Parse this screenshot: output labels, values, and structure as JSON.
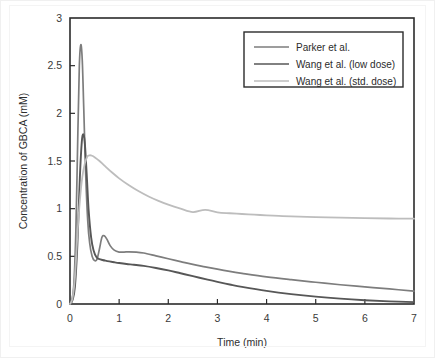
{
  "chart_data": {
    "type": "line",
    "title": "",
    "xlabel": "Time (min)",
    "ylabel": "Concentration of GBCA (mM)",
    "xlim": [
      0,
      7
    ],
    "ylim": [
      0,
      3
    ],
    "xticks": [
      0,
      1,
      2,
      3,
      4,
      5,
      6,
      7
    ],
    "xtick_labels": [
      "0",
      "1",
      "2",
      "3",
      "4",
      "5",
      "6",
      "7"
    ],
    "yticks": [
      0,
      0.5,
      1,
      1.5,
      2,
      2.5,
      3
    ],
    "ytick_labels": [
      "0",
      "0.5",
      "1",
      "1.5",
      "2",
      "2.5",
      "3"
    ],
    "grid": false,
    "legend_position": "top-right",
    "series": [
      {
        "name": "Parker et al.",
        "color": "#7d7d7d",
        "linewidth": 1.7,
        "x": [
          0,
          0.04,
          0.08,
          0.12,
          0.16,
          0.19,
          0.22,
          0.25,
          0.28,
          0.32,
          0.36,
          0.4,
          0.45,
          0.5,
          0.55,
          0.6,
          0.65,
          0.7,
          0.75,
          0.82,
          0.9,
          1.0,
          1.1,
          1.2,
          1.35,
          1.5,
          1.75,
          2.0,
          2.25,
          2.5,
          2.75,
          3.0,
          3.25,
          3.5,
          4.0,
          4.5,
          5.0,
          5.5,
          6.0,
          6.5,
          7.0
        ],
        "y": [
          0.0,
          0.05,
          0.22,
          0.78,
          1.8,
          2.5,
          2.72,
          2.55,
          2.05,
          1.35,
          0.88,
          0.64,
          0.5,
          0.455,
          0.47,
          0.58,
          0.7,
          0.715,
          0.68,
          0.61,
          0.565,
          0.545,
          0.545,
          0.547,
          0.545,
          0.535,
          0.505,
          0.475,
          0.445,
          0.415,
          0.39,
          0.365,
          0.342,
          0.322,
          0.285,
          0.255,
          0.228,
          0.202,
          0.18,
          0.158,
          0.135
        ]
      },
      {
        "name": "Wang et al. (low dose)",
        "color": "#575757",
        "linewidth": 1.9,
        "x": [
          0,
          0.05,
          0.1,
          0.15,
          0.2,
          0.24,
          0.27,
          0.3,
          0.34,
          0.38,
          0.43,
          0.48,
          0.54,
          0.6,
          0.66,
          0.72,
          0.8,
          0.9,
          1.0,
          1.15,
          1.3,
          1.5,
          1.75,
          2.0,
          2.25,
          2.5,
          2.8,
          3.0,
          3.25,
          3.5,
          4.0,
          4.5,
          5.0,
          5.5,
          6.0,
          6.5,
          7.0
        ],
        "y": [
          0.0,
          0.04,
          0.18,
          0.62,
          1.32,
          1.7,
          1.78,
          1.7,
          1.36,
          0.98,
          0.7,
          0.56,
          0.49,
          0.47,
          0.462,
          0.455,
          0.447,
          0.438,
          0.43,
          0.42,
          0.412,
          0.4,
          0.378,
          0.352,
          0.322,
          0.292,
          0.255,
          0.232,
          0.205,
          0.18,
          0.138,
          0.104,
          0.077,
          0.056,
          0.04,
          0.028,
          0.02
        ]
      },
      {
        "name": "Wang et al. (std. dose)",
        "color": "#bdbdbd",
        "linewidth": 1.8,
        "x": [
          0,
          0.05,
          0.1,
          0.15,
          0.2,
          0.25,
          0.3,
          0.35,
          0.4,
          0.45,
          0.5,
          0.6,
          0.7,
          0.85,
          1.0,
          1.2,
          1.4,
          1.6,
          1.8,
          2.0,
          2.25,
          2.5,
          2.75,
          3.0,
          3.25,
          3.5,
          3.75,
          4.0,
          4.5,
          5.0,
          5.5,
          6.0,
          6.5,
          7.0
        ],
        "y": [
          0.0,
          0.06,
          0.28,
          0.72,
          1.08,
          1.33,
          1.47,
          1.545,
          1.56,
          1.555,
          1.54,
          1.5,
          1.452,
          1.382,
          1.318,
          1.245,
          1.182,
          1.128,
          1.082,
          1.042,
          1.0,
          0.0964,
          0.0,
          0.0,
          0.0,
          0.0,
          0.0,
          0.0,
          0.0,
          0.0,
          0.0,
          0.0,
          0.0,
          0.0
        ]
      }
    ],
    "series_std_dose_tail": {
      "x": [
        2.5,
        2.75,
        3.0,
        3.25,
        3.5,
        3.75,
        4.0,
        4.25,
        4.5,
        5.0,
        5.5,
        6.0,
        6.5,
        7.0
      ],
      "y": [
        0.964,
        0.988,
        0.962,
        0.952,
        0.944,
        0.937,
        0.93,
        0.924,
        0.919,
        0.911,
        0.905,
        0.9,
        0.897,
        0.895
      ]
    }
  },
  "legend": {
    "entries": [
      {
        "label": "Parker et al."
      },
      {
        "label": "Wang et al. (low dose)"
      },
      {
        "label": "Wang et al. (std. dose)"
      }
    ]
  },
  "axes": {
    "x_title": "Time (min)",
    "y_title": "Concentration of GBCA (mM)"
  }
}
